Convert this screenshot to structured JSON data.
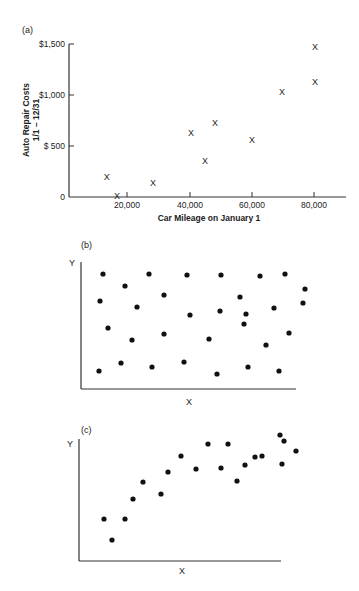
{
  "chart_data": [
    {
      "panel": "(a)",
      "type": "scatter",
      "marker": "x",
      "title": "",
      "xlabel": "Car Mileage on January 1",
      "ylabel": "Auto Repair Costs",
      "ylabel_sub": "1/1 – 12/31",
      "x_ticks": [
        "20,000",
        "40,000",
        "60,000",
        "80,000"
      ],
      "y_ticks": [
        "0",
        "$ 500",
        "$1,000",
        "$1,500"
      ],
      "xlim": [
        0,
        90000
      ],
      "ylim": [
        0,
        1500
      ],
      "grid": false,
      "points": [
        {
          "x": 13500,
          "y": 200
        },
        {
          "x": 16800,
          "y": 10
        },
        {
          "x": 28400,
          "y": 140
        },
        {
          "x": 40600,
          "y": 630
        },
        {
          "x": 45200,
          "y": 350
        },
        {
          "x": 48400,
          "y": 730
        },
        {
          "x": 60300,
          "y": 560
        },
        {
          "x": 70000,
          "y": 1030
        },
        {
          "x": 80600,
          "y": 1130
        },
        {
          "x": 80600,
          "y": 1470
        }
      ]
    },
    {
      "panel": "(b)",
      "type": "scatter",
      "marker": "dot",
      "xlabel": "X",
      "ylabel": "Y",
      "description": "No apparent relationship (random scatter)",
      "points_px": [
        [
          103,
          274
        ],
        [
          125,
          286
        ],
        [
          149,
          274
        ],
        [
          187,
          275
        ],
        [
          221,
          275
        ],
        [
          260,
          276
        ],
        [
          285,
          274
        ],
        [
          100,
          301
        ],
        [
          137,
          307
        ],
        [
          164,
          295
        ],
        [
          240,
          297
        ],
        [
          274,
          308
        ],
        [
          108,
          328
        ],
        [
          190,
          315
        ],
        [
          220,
          311
        ],
        [
          305,
          289
        ],
        [
          246,
          314
        ],
        [
          132,
          340
        ],
        [
          164,
          334
        ],
        [
          209,
          339
        ],
        [
          266,
          345
        ],
        [
          289,
          333
        ],
        [
          244,
          324
        ],
        [
          99,
          371
        ],
        [
          121,
          363
        ],
        [
          152,
          367
        ],
        [
          184,
          362
        ],
        [
          217,
          374
        ],
        [
          248,
          367
        ],
        [
          279,
          371
        ],
        [
          303,
          303
        ]
      ]
    },
    {
      "panel": "(c)",
      "type": "scatter",
      "marker": "dot",
      "xlabel": "X",
      "ylabel": "Y",
      "description": "Positive curvilinear relationship that levels off",
      "points_px": [
        [
          104,
          519
        ],
        [
          112,
          540
        ],
        [
          125,
          519
        ],
        [
          133,
          499
        ],
        [
          143,
          482
        ],
        [
          161,
          494
        ],
        [
          168,
          472
        ],
        [
          181,
          456
        ],
        [
          196,
          469
        ],
        [
          208,
          444
        ],
        [
          221,
          468
        ],
        [
          228,
          444
        ],
        [
          237,
          481
        ],
        [
          245,
          465
        ],
        [
          255,
          457
        ],
        [
          262,
          456
        ],
        [
          282,
          464
        ],
        [
          280,
          435
        ],
        [
          296,
          451
        ],
        [
          284,
          441
        ]
      ]
    }
  ],
  "panels": {
    "a": {
      "label": "(a)",
      "xlabel": "Car Mileage on January 1",
      "ylabel_line1": "Auto Repair Costs",
      "ylabel_line2": "1/1 – 12/31",
      "x_ticks": [
        "20,000",
        "40,000",
        "60,000",
        "80,000"
      ],
      "y_ticks": [
        "$1,500",
        "$1,000",
        "$ 500",
        "0"
      ],
      "marker_char": "X"
    },
    "b": {
      "label": "(b)",
      "xlabel": "X",
      "ylabel": "Y"
    },
    "c": {
      "label": "(c)",
      "xlabel": "X",
      "ylabel": "Y"
    }
  }
}
